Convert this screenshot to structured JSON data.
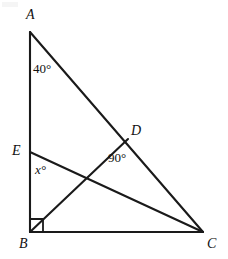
{
  "figure": {
    "kind": "geometry-diagram",
    "background_color": "#ffffff",
    "stroke_color": "#1a1a1a",
    "width": 228,
    "height": 259,
    "vertices": [
      {
        "id": "A",
        "label": "A",
        "x": 30,
        "y": 32,
        "label_x": 26,
        "label_y": 8
      },
      {
        "id": "B",
        "label": "B",
        "x": 30,
        "y": 232,
        "label_x": 19,
        "label_y": 237
      },
      {
        "id": "C",
        "label": "C",
        "x": 203,
        "y": 232,
        "label_x": 207,
        "label_y": 237
      },
      {
        "id": "D",
        "label": "D",
        "x": 128,
        "y": 139,
        "label_x": 131,
        "label_y": 124
      },
      {
        "id": "E",
        "label": "E",
        "x": 30,
        "y": 152,
        "label_x": 12,
        "label_y": 144
      }
    ],
    "segments": [
      {
        "id": "AB",
        "from": "A",
        "to": "B"
      },
      {
        "id": "BC",
        "from": "B",
        "to": "C"
      },
      {
        "id": "AC",
        "from": "A",
        "to": "C"
      },
      {
        "id": "BD",
        "from": "B",
        "to": "D"
      },
      {
        "id": "EC",
        "from": "E",
        "to": "C"
      }
    ],
    "angle_labels": [
      {
        "id": "angle-a",
        "text": "40°",
        "at_vertex": "A",
        "x": 33,
        "y": 62,
        "italic": false
      },
      {
        "id": "angle-d",
        "text": "90°",
        "at_vertex": "D",
        "x": 108,
        "y": 151,
        "italic": false
      },
      {
        "id": "angle-e",
        "text": "x°",
        "at_vertex": "E",
        "x": 35,
        "y": 163,
        "italic": true
      }
    ],
    "right_angle_marks": [
      {
        "id": "right-angle-b",
        "at_vertex": "B",
        "x": 30,
        "y": 232,
        "size": 13
      }
    ]
  }
}
